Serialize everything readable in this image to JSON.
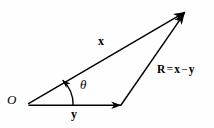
{
  "figure": {
    "kind": "vector-triangle-diagram",
    "background_color": "#fefefe",
    "stroke_color": "#000000",
    "width": 214,
    "height": 128,
    "labels": {
      "origin": "O",
      "vector_x": "x",
      "vector_y": "y",
      "angle": "θ",
      "resultant_R": "R",
      "resultant_equals": "=",
      "resultant_x": "x",
      "resultant_minus": "−",
      "resultant_y": "y",
      "resultant_full": "R = x − y"
    },
    "geometry": {
      "origin_point": [
        28,
        104
      ],
      "apex_point": [
        185,
        12
      ],
      "y_tip_point": [
        121,
        105
      ],
      "x_vector": {
        "from": [
          28,
          104
        ],
        "to": [
          185,
          12
        ]
      },
      "y_vector": {
        "from": [
          28,
          105
        ],
        "to": [
          121,
          105
        ]
      },
      "r_vector": {
        "from": [
          121,
          105
        ],
        "to": [
          185,
          12
        ]
      },
      "angle_arc": {
        "from": [
          73,
          105
        ],
        "to": [
          62,
          79
        ],
        "center": [
          28,
          104
        ],
        "radius": 46
      }
    }
  }
}
